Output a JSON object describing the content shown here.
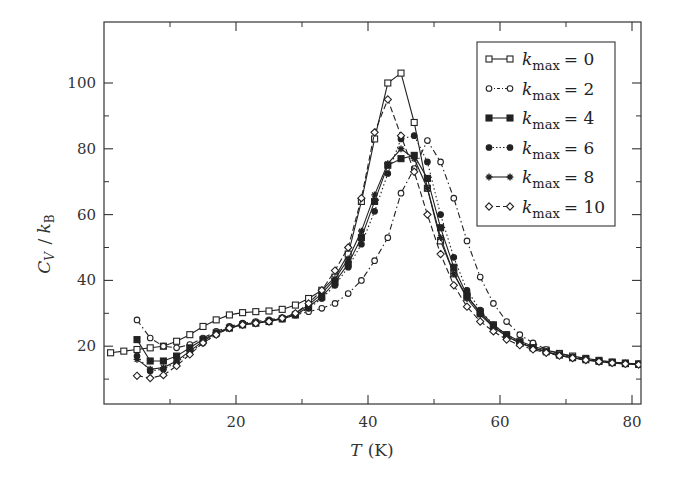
{
  "chart_data": {
    "type": "line",
    "title": "",
    "xlabel": "T (K)",
    "xlabel_italic": "T",
    "xlabel_unit": "(K)",
    "ylabel": "C_V / k_B",
    "xlim": [
      0,
      81.5
    ],
    "ylim": [
      3,
      105
    ],
    "xticks": [
      20,
      40,
      60,
      80
    ],
    "xminor": [
      10,
      30,
      50,
      70
    ],
    "yticks": [
      20,
      40,
      60,
      80,
      100
    ],
    "yminor": [
      10,
      30,
      50,
      70,
      90
    ],
    "grid": false,
    "legend_position": "upper right",
    "series": [
      {
        "name": "k_max = 0",
        "label_value": "0",
        "marker": "square-open",
        "line": "solid",
        "x": [
          1,
          3,
          5,
          7,
          9,
          11,
          13,
          15,
          17,
          19,
          21,
          23,
          25,
          27,
          29,
          31,
          33,
          35,
          37,
          39,
          41,
          43,
          45,
          47,
          49,
          51,
          53,
          55,
          57,
          59,
          61,
          63,
          65,
          67,
          69,
          71,
          73,
          75,
          77,
          79,
          81
        ],
        "y": [
          18,
          18.5,
          19,
          19.5,
          20,
          21.5,
          23.5,
          26,
          28,
          29.5,
          30.2,
          30.5,
          30.7,
          31.2,
          32.5,
          34.5,
          37,
          41,
          48,
          64,
          83,
          100,
          103,
          88,
          68,
          52,
          42,
          35,
          30.5,
          26.5,
          23.5,
          21.5,
          20,
          18.8,
          17.8,
          17,
          16.3,
          15.7,
          15.2,
          14.9,
          14.6
        ]
      },
      {
        "name": "k_max = 2",
        "label_value": "2",
        "marker": "circle-open",
        "line": "dashdot",
        "x": [
          5,
          7,
          9,
          11,
          13,
          15,
          17,
          19,
          21,
          23,
          25,
          27,
          29,
          31,
          33,
          35,
          37,
          39,
          41,
          43,
          45,
          47,
          49,
          51,
          53,
          55,
          57,
          59,
          61,
          63,
          65,
          67,
          69,
          71,
          73,
          75,
          77,
          79,
          81
        ],
        "y": [
          28,
          22.5,
          20,
          19.5,
          20.5,
          22.5,
          24.5,
          26,
          27,
          27.5,
          28,
          28.7,
          29.5,
          30.5,
          31.5,
          33,
          36,
          40,
          46,
          53,
          66.5,
          74,
          82.5,
          76,
          65,
          52,
          41,
          33,
          27.5,
          23.5,
          21,
          19,
          17.8,
          16.8,
          16.2,
          15.6,
          15.2,
          14.9,
          14.6
        ]
      },
      {
        "name": "k_max = 4",
        "label_value": "4",
        "marker": "square-filled",
        "line": "solid",
        "x": [
          5,
          7,
          9,
          11,
          13,
          15,
          17,
          19,
          21,
          23,
          25,
          27,
          29,
          31,
          33,
          35,
          37,
          39,
          41,
          43,
          45,
          47,
          49,
          51,
          53,
          55,
          57,
          59,
          61,
          63,
          65,
          67,
          69,
          71,
          73,
          75,
          77,
          79,
          81
        ],
        "y": [
          22,
          15.5,
          15.5,
          17,
          19.5,
          22,
          24,
          25.5,
          26.5,
          27,
          27.5,
          28.3,
          29.5,
          32,
          35,
          39.5,
          45,
          53,
          64,
          75,
          77,
          78,
          71,
          56,
          44,
          35.5,
          30,
          26,
          23,
          21,
          19.5,
          18.3,
          17.3,
          16.5,
          15.9,
          15.4,
          15,
          14.7,
          14.5
        ]
      },
      {
        "name": "k_max = 6",
        "label_value": "6",
        "marker": "circle-filled",
        "line": "dotted",
        "x": [
          5,
          7,
          9,
          11,
          13,
          15,
          17,
          19,
          21,
          23,
          25,
          27,
          29,
          31,
          33,
          35,
          37,
          39,
          41,
          43,
          45,
          47,
          49,
          51,
          53,
          55,
          57,
          59,
          61,
          63,
          65,
          67,
          69,
          71,
          73,
          75,
          77,
          79,
          81
        ],
        "y": [
          17,
          12.5,
          13,
          15,
          18,
          21,
          23.5,
          25.5,
          26.5,
          27,
          27.5,
          28.3,
          29.5,
          31.5,
          34.5,
          38.5,
          44,
          51,
          61,
          72.5,
          83,
          84,
          76,
          60,
          47,
          37,
          31,
          26.5,
          23.5,
          21.3,
          19.6,
          18.3,
          17.3,
          16.5,
          15.9,
          15.4,
          15,
          14.7,
          14.5
        ]
      },
      {
        "name": "k_max = 8",
        "label_value": "8",
        "marker": "asterisk",
        "line": "solid",
        "x": [
          5,
          7,
          9,
          11,
          13,
          15,
          17,
          19,
          21,
          23,
          25,
          27,
          29,
          31,
          33,
          35,
          37,
          39,
          41,
          43,
          45,
          47,
          49,
          51,
          53,
          55,
          57,
          59,
          61,
          63,
          65,
          67,
          69,
          71,
          73,
          75,
          77,
          79,
          81
        ],
        "y": [
          16,
          13,
          13.5,
          15.5,
          18.5,
          21.5,
          24,
          25.7,
          26.7,
          27.2,
          27.7,
          28.5,
          30,
          32.5,
          36,
          40.5,
          46.5,
          55,
          66,
          75.5,
          80,
          77,
          68,
          53,
          42,
          34.5,
          29.5,
          25.8,
          23,
          21,
          19.5,
          18.2,
          17.2,
          16.4,
          15.8,
          15.3,
          14.9,
          14.6,
          14.4
        ]
      },
      {
        "name": "k_max = 10",
        "label_value": "10",
        "marker": "diamond-open",
        "line": "dashed",
        "x": [
          5,
          7,
          9,
          11,
          13,
          15,
          17,
          19,
          21,
          23,
          25,
          27,
          29,
          31,
          33,
          35,
          37,
          39,
          41,
          43,
          45,
          47,
          49,
          51,
          53,
          55,
          57,
          59,
          61,
          63,
          65,
          67,
          69,
          71,
          73,
          75,
          77,
          79,
          81
        ],
        "y": [
          11,
          10.3,
          11.2,
          14,
          17.5,
          21,
          23.5,
          25.5,
          26.5,
          27,
          27.5,
          28.5,
          30,
          33,
          37,
          43,
          50,
          65,
          85,
          95,
          84,
          73,
          60,
          48,
          38.5,
          32,
          27.5,
          24.5,
          22,
          20.3,
          19,
          18,
          17.1,
          16.4,
          15.8,
          15.3,
          14.9,
          14.6,
          14.4
        ]
      }
    ]
  },
  "legend": {
    "k_symbol": "k",
    "subscript": "max",
    "equals": "="
  },
  "colors": {
    "line": "#222222",
    "axis": "#333333",
    "background": "#ffffff"
  }
}
